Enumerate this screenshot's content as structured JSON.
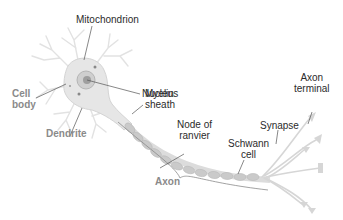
{
  "diagram": {
    "colors": {
      "label_dark": "#2b2b2b",
      "label_grey": "#8a8a8a",
      "cell_fill": "#e6e6e6",
      "nucleus": "#bdbdbd",
      "myelin": "#c8c8c8",
      "leader_line": "#666666"
    },
    "labels": {
      "mitochondrion": "Mitochondrion",
      "nucleus": "Nucleus",
      "cell_body": "Cell\nbody",
      "dendrite": "Dendrite",
      "myelin_sheath": "Myelin\nsheath",
      "node_of_ranvier": "Node of\nranvier",
      "axon": "Axon",
      "schwann_cell": "Schwann\ncell",
      "synapse": "Synapse",
      "axon_terminal": "Axon\nterminal"
    }
  }
}
